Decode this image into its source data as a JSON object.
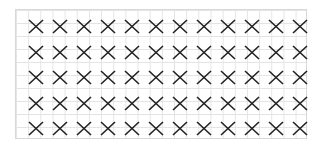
{
  "board": {
    "rows": 5,
    "cols": 12,
    "mark": "X",
    "mark_color": "#222222",
    "grid_line_color": "#e4e4e4",
    "cells": [
      [
        "X",
        "X",
        "X",
        "X",
        "X",
        "X",
        "X",
        "X",
        "X",
        "X",
        "X",
        "X"
      ],
      [
        "X",
        "X",
        "X",
        "X",
        "X",
        "X",
        "X",
        "X",
        "X",
        "X",
        "X",
        "X"
      ],
      [
        "X",
        "X",
        "X",
        "X",
        "X",
        "X",
        "X",
        "X",
        "X",
        "X",
        "X",
        "X"
      ],
      [
        "X",
        "X",
        "X",
        "X",
        "X",
        "X",
        "X",
        "X",
        "X",
        "X",
        "X",
        "X"
      ],
      [
        "X",
        "X",
        "X",
        "X",
        "X",
        "X",
        "X",
        "X",
        "X",
        "X",
        "X",
        "X"
      ]
    ]
  }
}
